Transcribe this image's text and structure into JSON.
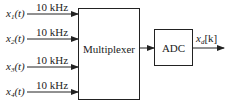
{
  "diagram": {
    "inputs": [
      {
        "signal": "x",
        "subscript": "1",
        "arg": "(t)",
        "rate": "10 kHz"
      },
      {
        "signal": "x",
        "subscript": "2",
        "arg": "(t)",
        "rate": "10 kHz"
      },
      {
        "signal": "x",
        "subscript": "3",
        "arg": "(t)",
        "rate": "10 kHz"
      },
      {
        "signal": "x",
        "subscript": "4",
        "arg": "(t)",
        "rate": "10 kHz"
      }
    ],
    "blocks": {
      "multiplexer": "Multiplexer",
      "adc": "ADC"
    },
    "output": {
      "signal": "x",
      "subscript": "d",
      "arg": "[k]"
    },
    "colors": {
      "stroke": "#222222",
      "background": "#ffffff"
    }
  }
}
